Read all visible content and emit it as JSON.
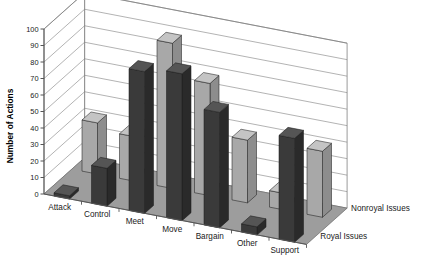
{
  "chart_data": {
    "type": "bar",
    "title": "",
    "subtitle": "",
    "xlabel": "",
    "ylabel": "Number of Actions",
    "ylim": [
      0,
      100
    ],
    "ytick_step": 10,
    "yticks": [
      "0",
      "10",
      "20",
      "30",
      "40",
      "50",
      "60",
      "70",
      "80",
      "90",
      "100"
    ],
    "grid": true,
    "projection": "3d",
    "legend_position": "right-bottom",
    "categories": [
      "Attack",
      "Control",
      "Meet",
      "Move",
      "Bargain",
      "Other",
      "Support"
    ],
    "series": [
      {
        "name": "Nonroyal Issues",
        "row": "back",
        "color": "#a8a8a8",
        "values": [
          31,
          27,
          88,
          68,
          38,
          10,
          40
        ]
      },
      {
        "name": "Royal Issues",
        "row": "front",
        "color": "#3a3a3a",
        "values": [
          2,
          23,
          86,
          89,
          70,
          5,
          63
        ]
      }
    ]
  },
  "axis": {
    "y_title": "Number of Actions"
  },
  "legend": {
    "entries": [
      {
        "label": "Nonroyal Issues"
      },
      {
        "label": "Royal Issues"
      }
    ]
  },
  "colors": {
    "bar_front_dark": "#3a3a3a",
    "bar_front_dark_side": "#2a2a2a",
    "bar_front_dark_top": "#555555",
    "bar_back_light": "#a8a8a8",
    "bar_back_light_side": "#8d8d8d",
    "bar_back_light_top": "#c4c4c4",
    "floor": "#9d9d9d",
    "wall": "#ffffff",
    "gridline": "#808080",
    "axis": "#555555",
    "text": "#1a1a1a"
  }
}
